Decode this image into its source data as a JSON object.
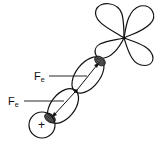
{
  "diagram": {
    "type": "orbital-overlap-schematic",
    "labels": {
      "force_upper": {
        "main": "F",
        "sub": "e"
      },
      "force_lower": {
        "main": "F",
        "sub": "e"
      },
      "nucleus_sign": "+"
    },
    "elements": [
      {
        "id": "d-orbital",
        "shape": "four-lobed clover"
      },
      {
        "id": "upper-bond-ellipse",
        "shape": "ellipse",
        "shaded_end": "top"
      },
      {
        "id": "lower-bond-ellipse",
        "shape": "ellipse",
        "shaded_end": "bottom"
      },
      {
        "id": "nucleus-circle",
        "shape": "circle",
        "mark": "+"
      }
    ],
    "colors": {
      "stroke": "#111111",
      "background": "#ffffff",
      "shade": "#333333"
    }
  }
}
